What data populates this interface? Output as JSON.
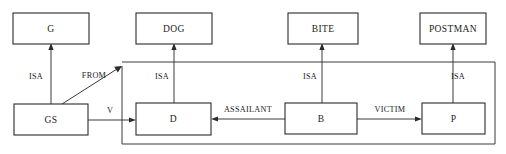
{
  "diagram": {
    "type": "semantic-network",
    "canvas": {
      "width": 506,
      "height": 154,
      "background": "#ffffff"
    },
    "stroke_color": "#3a3a3a",
    "text_color": "#1a1a1a",
    "nodes": [
      {
        "id": "g",
        "label": "G",
        "x": 13,
        "y": 13,
        "w": 76,
        "h": 31,
        "row": "top"
      },
      {
        "id": "dog",
        "label": "DOG",
        "x": 136,
        "y": 13,
        "w": 76,
        "h": 31,
        "row": "top"
      },
      {
        "id": "bite",
        "label": "BITE",
        "x": 288,
        "y": 13,
        "w": 70,
        "h": 31,
        "row": "top"
      },
      {
        "id": "postman",
        "label": "POSTMAN",
        "x": 420,
        "y": 13,
        "w": 66,
        "h": 31,
        "row": "top"
      },
      {
        "id": "gs",
        "label": "GS",
        "x": 14,
        "y": 104,
        "w": 74,
        "h": 31,
        "row": "bottom"
      },
      {
        "id": "d",
        "label": "D",
        "x": 136,
        "y": 103,
        "w": 75,
        "h": 32,
        "row": "bottom"
      },
      {
        "id": "b",
        "label": "B",
        "x": 285,
        "y": 103,
        "w": 72,
        "h": 31,
        "row": "bottom"
      },
      {
        "id": "p",
        "label": "P",
        "x": 422,
        "y": 103,
        "w": 63,
        "h": 31,
        "row": "bottom"
      }
    ],
    "edges": [
      {
        "id": "isa-gs-g",
        "label": "ISA",
        "from": "gs",
        "to": "g",
        "kind": "vertical-up",
        "label_x": 36,
        "label_y": 77
      },
      {
        "id": "isa-d-dog",
        "label": "ISA",
        "from": "d",
        "to": "dog",
        "kind": "vertical-up",
        "label_x": 162,
        "label_y": 77
      },
      {
        "id": "isa-b-bite",
        "label": "ISA",
        "from": "b",
        "to": "bite",
        "kind": "vertical-up",
        "label_x": 310,
        "label_y": 77
      },
      {
        "id": "isa-p-postman",
        "label": "ISA",
        "from": "p",
        "to": "postman",
        "kind": "vertical-up",
        "label_x": 458,
        "label_y": 77
      },
      {
        "id": "from-gs-d",
        "label": "FROM",
        "from": "gs",
        "to": "d",
        "kind": "diagonal-up",
        "label_x": 94,
        "label_y": 76
      },
      {
        "id": "v-gs-d",
        "label": "V",
        "from": "gs",
        "to": "d",
        "kind": "horizontal",
        "label_x": 110,
        "label_y": 112
      },
      {
        "id": "assailant-b-d",
        "label": "ASSAILANT",
        "from": "b",
        "to": "d",
        "kind": "horizontal-left",
        "label_x": 248,
        "label_y": 112
      },
      {
        "id": "victim-b-p",
        "label": "VICTIM",
        "from": "b",
        "to": "p",
        "kind": "horizontal",
        "label_x": 390,
        "label_y": 112
      },
      {
        "id": "route-right-top",
        "label": "",
        "from": "p",
        "to": "d",
        "kind": "routed",
        "label_x": 0,
        "label_y": 0
      }
    ]
  }
}
